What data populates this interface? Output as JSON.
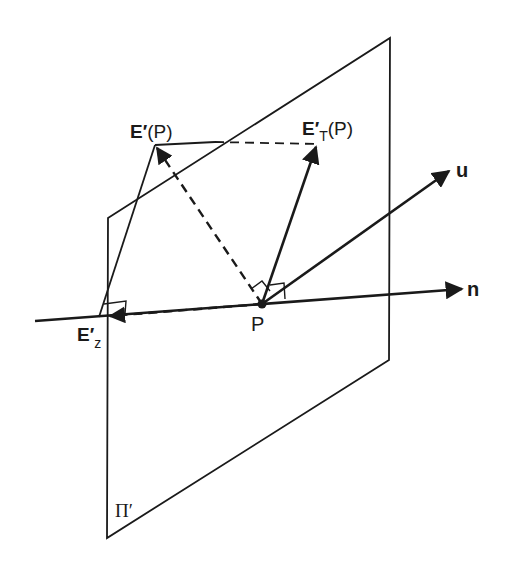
{
  "diagram": {
    "type": "vector-projection-geometry",
    "plane_label": "Π′",
    "point_label": "P",
    "labels": {
      "E_P": {
        "main": "E′",
        "suffix": "(P)"
      },
      "E_T": {
        "main": "E′",
        "sub": "T",
        "suffix": "(P)"
      },
      "E_z": {
        "main": "E′",
        "sub": "z"
      },
      "u": "u",
      "n": "n",
      "P": "P",
      "plane": "Π′"
    },
    "colors": {
      "stroke": "#1a1a1a",
      "background": "#ffffff"
    },
    "elements": [
      {
        "name": "plane-Pi-prime",
        "kind": "parallelogram",
        "corners": [
          [
            108,
            218
          ],
          [
            390,
            38
          ],
          [
            389,
            360
          ],
          [
            107,
            538
          ]
        ]
      },
      {
        "name": "normal-axis-n",
        "kind": "arrow",
        "from": [
          35,
          321
        ],
        "to": [
          463,
          289
        ]
      },
      {
        "name": "vector-u",
        "kind": "arrow",
        "from": [
          262,
          304
        ],
        "to": [
          450,
          170
        ]
      },
      {
        "name": "vector-E-prime-T",
        "kind": "arrow",
        "from": [
          262,
          304
        ],
        "to": [
          317,
          145
        ]
      },
      {
        "name": "vector-E-prime-P",
        "kind": "dashed-arrow",
        "from": [
          262,
          304
        ],
        "to": [
          155,
          145
        ]
      },
      {
        "name": "vector-E-prime-z",
        "kind": "dashed-arrow",
        "from": [
          262,
          304
        ],
        "to": [
          108,
          317
        ]
      },
      {
        "name": "line-EP-to-ET",
        "kind": "solid+dashed",
        "from": [
          155,
          145
        ],
        "to": [
          317,
          145
        ]
      },
      {
        "name": "line-EP-to-Ez",
        "kind": "line",
        "from": [
          155,
          145
        ],
        "to": [
          99,
          317
        ]
      }
    ]
  }
}
